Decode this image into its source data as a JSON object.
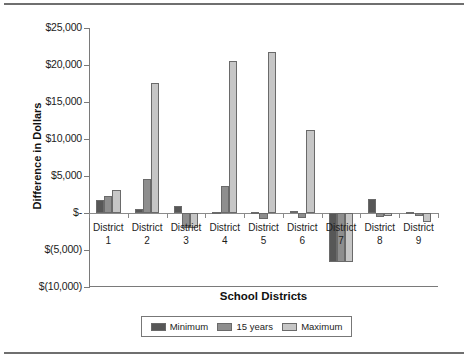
{
  "chart_data": {
    "type": "bar",
    "title": "",
    "xlabel": "School Districts",
    "ylabel": "Difference in Dollars",
    "categories": [
      "District 1",
      "District 2",
      "District 3",
      "District 4",
      "District 5",
      "District 6",
      "District 7",
      "District 8",
      "District 9"
    ],
    "category_names": [
      "District",
      "District",
      "District",
      "District",
      "District",
      "District",
      "District",
      "District",
      "District"
    ],
    "category_numbers": [
      "1",
      "2",
      "3",
      "4",
      "5",
      "6",
      "7",
      "8",
      "9"
    ],
    "series": [
      {
        "name": "Minimum",
        "color": "#575757",
        "values": [
          1750,
          600,
          900,
          150,
          200,
          300,
          -6600,
          1900,
          100
        ]
      },
      {
        "name": "15 years",
        "color": "#8e8e8e",
        "values": [
          2350,
          4600,
          -2000,
          3700,
          -800,
          -700,
          -6600,
          -500,
          -400
        ]
      },
      {
        "name": "Maximum",
        "color": "#c6c6c6",
        "values": [
          3150,
          17600,
          -2000,
          20500,
          21800,
          11200,
          -6600,
          -400,
          -1200
        ]
      }
    ],
    "ylim": [
      -10000,
      25000
    ],
    "ytick_values": [
      25000,
      20000,
      15000,
      10000,
      5000,
      0,
      -5000,
      -10000
    ],
    "ytick_labels": [
      "$25,000",
      "$20,000",
      "$15,000",
      "$10,000",
      "$5,000",
      "$-",
      "$(5,000)",
      "$(10,000)"
    ],
    "grid": false,
    "legend_position": "bottom"
  },
  "legend": {
    "items": [
      {
        "label": "Minimum"
      },
      {
        "label": "15 years"
      },
      {
        "label": "Maximum"
      }
    ]
  }
}
